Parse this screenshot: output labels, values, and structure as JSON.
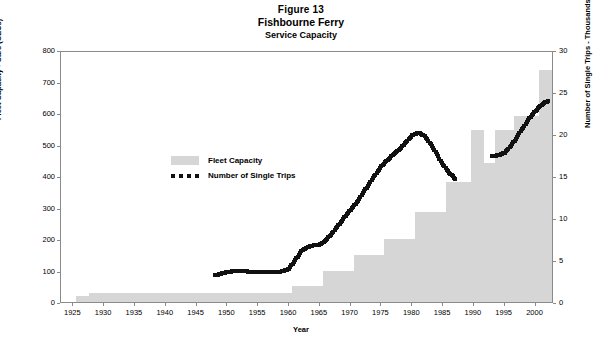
{
  "figure": {
    "number": "Figure 13",
    "name": "Fishbourne Ferry",
    "subtitle": "Service Capacity"
  },
  "legend": {
    "position": "inside-top-left",
    "items": [
      {
        "label": "Fleet Capacity",
        "marker": "gray-swatch",
        "color": "#d6d6d6"
      },
      {
        "label": "Number of Single Trips",
        "marker": "black-dotted-line",
        "color": "#111111"
      }
    ]
  },
  "chart_data": {
    "type": "bar",
    "xlabel": "Year",
    "ylabel": "Fleet Capacity - Cars (CEUs)",
    "y2label": "Number of Single Trips - Thousands",
    "xlim": [
      1923,
      2003
    ],
    "ylim": [
      0,
      800
    ],
    "y2lim": [
      0,
      30
    ],
    "yticks": [
      0,
      100,
      200,
      300,
      400,
      500,
      600,
      700,
      800
    ],
    "y2ticks": [
      0,
      5,
      10,
      15,
      20,
      25,
      30
    ],
    "xticks": [
      1925,
      1930,
      1935,
      1940,
      1945,
      1950,
      1955,
      1960,
      1965,
      1970,
      1975,
      1980,
      1985,
      1990,
      1995,
      2000
    ],
    "grid": false,
    "series": [
      {
        "name": "Fleet Capacity",
        "type": "bar",
        "axis": "left",
        "units": "CEUs",
        "color": "#d6d6d6",
        "x": [
          1926,
          1927,
          1928,
          1929,
          1930,
          1931,
          1932,
          1933,
          1934,
          1935,
          1936,
          1937,
          1938,
          1939,
          1940,
          1941,
          1942,
          1943,
          1944,
          1945,
          1946,
          1947,
          1948,
          1949,
          1950,
          1951,
          1952,
          1953,
          1954,
          1955,
          1956,
          1957,
          1958,
          1959,
          1960,
          1961,
          1962,
          1963,
          1964,
          1965,
          1966,
          1967,
          1968,
          1969,
          1970,
          1971,
          1972,
          1973,
          1974,
          1975,
          1976,
          1977,
          1978,
          1979,
          1980,
          1981,
          1982,
          1983,
          1984,
          1985,
          1986,
          1987,
          1988,
          1989,
          1990,
          1991,
          1992,
          1993,
          1994,
          1995,
          1996,
          1997,
          1998,
          1999,
          2000,
          2001,
          2002
        ],
        "values": [
          18,
          18,
          30,
          30,
          30,
          30,
          30,
          30,
          30,
          30,
          30,
          30,
          30,
          30,
          30,
          30,
          30,
          30,
          30,
          30,
          30,
          30,
          30,
          30,
          30,
          30,
          30,
          30,
          30,
          30,
          30,
          30,
          30,
          30,
          30,
          52,
          52,
          52,
          52,
          52,
          100,
          100,
          100,
          100,
          100,
          150,
          150,
          150,
          150,
          150,
          200,
          200,
          200,
          200,
          200,
          285,
          285,
          285,
          285,
          285,
          380,
          380,
          380,
          380,
          545,
          545,
          440,
          440,
          545,
          545,
          545,
          590,
          590,
          590,
          590,
          735,
          735
        ]
      },
      {
        "name": "Number of Single Trips",
        "type": "line",
        "style": "dotted",
        "axis": "right",
        "units": "thousands",
        "color": "#111111",
        "x": [
          1948,
          1949,
          1950,
          1951,
          1952,
          1953,
          1954,
          1955,
          1956,
          1957,
          1958,
          1959,
          1960,
          1961,
          1962,
          1963,
          1964,
          1965,
          1966,
          1967,
          1968,
          1969,
          1970,
          1971,
          1972,
          1973,
          1974,
          1975,
          1976,
          1977,
          1978,
          1979,
          1980,
          1981,
          1982,
          1983,
          1984,
          1985,
          1986,
          1987,
          1993,
          1994,
          1995,
          1996,
          1997,
          1998,
          1999,
          2000,
          2001,
          2002
        ],
        "values": [
          3.4,
          3.6,
          3.8,
          3.9,
          3.9,
          3.9,
          3.8,
          3.8,
          3.8,
          3.8,
          3.8,
          3.9,
          4.2,
          5.2,
          6.3,
          6.8,
          7.0,
          7.1,
          7.6,
          8.4,
          9.4,
          10.3,
          11.2,
          12.1,
          13.2,
          14.3,
          15.4,
          16.4,
          17.2,
          17.8,
          18.4,
          19.3,
          20.1,
          20.4,
          20.0,
          19.0,
          17.8,
          16.6,
          15.6,
          14.9,
          17.6,
          17.7,
          18.0,
          18.8,
          19.9,
          21.0,
          22.1,
          23.0,
          23.7,
          24.2
        ]
      }
    ]
  }
}
